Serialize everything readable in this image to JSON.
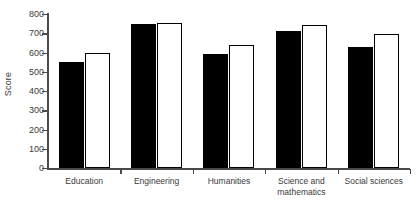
{
  "chart_data": {
    "type": "bar",
    "title": "",
    "subtitle": "",
    "xlabel": "",
    "ylabel": "Score",
    "categories": [
      "Education",
      "Engineering",
      "Humanities",
      "Science and\nmathematics",
      "Social sciences"
    ],
    "series": [
      {
        "name": "series-1-filled",
        "color": "#000000",
        "values": [
          550,
          750,
          590,
          710,
          630
        ]
      },
      {
        "name": "series-2-open",
        "color": "#ffffff",
        "values": [
          595,
          755,
          640,
          745,
          695
        ]
      }
    ],
    "ylim": [
      0,
      800
    ],
    "ytick_values": [
      0,
      100,
      200,
      300,
      400,
      500,
      600,
      700,
      800
    ],
    "ytick_labels": [
      "0",
      "100",
      "200",
      "300",
      "400",
      "500",
      "600",
      "700",
      "800"
    ],
    "grid": false,
    "legend": "none",
    "axis_color": "#4a4a4a",
    "background": "#ffffff"
  }
}
